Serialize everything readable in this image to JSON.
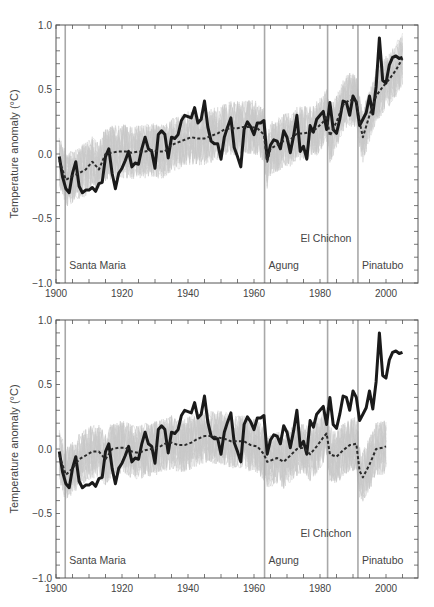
{
  "chart_data": [
    {
      "type": "line",
      "panel": "top",
      "title": "",
      "xlabel": "",
      "ylabel": "Temperature anomaly (°C)",
      "xlim": [
        1900,
        2008
      ],
      "ylim": [
        -1.0,
        1.0
      ],
      "x_ticks": [
        "1900",
        "1920",
        "1940",
        "1960",
        "1980",
        "2000"
      ],
      "y_ticks": [
        "1.0",
        "0.5",
        "0.0",
        "-0.5",
        "-1.0"
      ],
      "grid": false,
      "volcanoes": [
        {
          "name": "Santa Maria",
          "year": 1902.8,
          "label_row": "low"
        },
        {
          "name": "Agung",
          "year": 1963.2,
          "label_row": "low"
        },
        {
          "name": "El Chichon",
          "year": 1982.3,
          "label_row": "high"
        },
        {
          "name": "Pinatubo",
          "year": 1991.5,
          "label_row": "low"
        }
      ],
      "series": [
        {
          "name": "Observations",
          "style": "solid-thick-black",
          "x": [
            1901,
            1902,
            1903,
            1904,
            1905,
            1906,
            1907,
            1908,
            1909,
            1910,
            1911,
            1912,
            1913,
            1914,
            1915,
            1916,
            1917,
            1918,
            1919,
            1920,
            1921,
            1922,
            1923,
            1924,
            1925,
            1926,
            1927,
            1928,
            1929,
            1930,
            1931,
            1932,
            1933,
            1934,
            1935,
            1936,
            1937,
            1938,
            1939,
            1940,
            1941,
            1942,
            1943,
            1944,
            1945,
            1946,
            1947,
            1948,
            1949,
            1950,
            1951,
            1952,
            1953,
            1954,
            1955,
            1956,
            1957,
            1958,
            1959,
            1960,
            1961,
            1962,
            1963,
            1964,
            1965,
            1966,
            1967,
            1968,
            1969,
            1970,
            1971,
            1972,
            1973,
            1974,
            1975,
            1976,
            1977,
            1978,
            1979,
            1980,
            1981,
            1982,
            1983,
            1984,
            1985,
            1986,
            1987,
            1988,
            1989,
            1990,
            1991,
            1992,
            1993,
            1994,
            1995,
            1996,
            1997,
            1998,
            1999,
            2000,
            2001,
            2002,
            2003,
            2004,
            2005
          ],
          "values": [
            -0.02,
            -0.18,
            -0.27,
            -0.3,
            -0.15,
            -0.06,
            -0.25,
            -0.3,
            -0.28,
            -0.28,
            -0.26,
            -0.29,
            -0.23,
            -0.22,
            -0.02,
            0.04,
            -0.15,
            -0.27,
            -0.15,
            -0.11,
            -0.05,
            0.02,
            -0.1,
            -0.07,
            -0.08,
            0.04,
            0.13,
            0.04,
            0.02,
            -0.11,
            0.15,
            0.18,
            0.15,
            -0.03,
            0.13,
            0.12,
            0.15,
            0.26,
            0.3,
            0.29,
            0.28,
            0.36,
            0.24,
            0.27,
            0.41,
            0.21,
            0.1,
            0.08,
            0.08,
            -0.04,
            0.13,
            0.21,
            0.28,
            0.05,
            -0.02,
            -0.1,
            0.19,
            0.25,
            0.21,
            0.15,
            0.24,
            0.24,
            0.26,
            -0.04,
            0.07,
            0.11,
            0.1,
            0.04,
            0.18,
            0.13,
            0.01,
            0.14,
            0.3,
            0.02,
            0.06,
            -0.04,
            0.22,
            0.17,
            0.27,
            0.3,
            0.33,
            0.19,
            0.4,
            0.19,
            0.16,
            0.27,
            0.41,
            0.4,
            0.3,
            0.45,
            0.4,
            0.22,
            0.27,
            0.32,
            0.45,
            0.31,
            0.52,
            0.9,
            0.57,
            0.55,
            0.69,
            0.75,
            0.76,
            0.74,
            0.75
          ]
        },
        {
          "name": "Ensemble mean (all forcings)",
          "style": "dashed-black",
          "x": [
            1901,
            1903,
            1905,
            1907,
            1909,
            1911,
            1913,
            1915,
            1917,
            1919,
            1921,
            1923,
            1925,
            1927,
            1929,
            1931,
            1933,
            1935,
            1937,
            1939,
            1941,
            1943,
            1945,
            1947,
            1949,
            1951,
            1953,
            1955,
            1957,
            1959,
            1961,
            1963,
            1964,
            1965,
            1967,
            1969,
            1971,
            1973,
            1975,
            1977,
            1979,
            1981,
            1982,
            1983,
            1985,
            1987,
            1989,
            1991,
            1992,
            1993,
            1995,
            1997,
            1999,
            2001,
            2003,
            2005
          ],
          "values": [
            -0.05,
            -0.2,
            -0.17,
            -0.15,
            -0.12,
            -0.06,
            -0.12,
            0.0,
            0.01,
            0.02,
            0.02,
            0.01,
            0.02,
            0.02,
            0.03,
            0.02,
            0.02,
            0.07,
            0.09,
            0.11,
            0.13,
            0.12,
            0.12,
            0.14,
            0.16,
            0.19,
            0.2,
            0.2,
            0.21,
            0.21,
            0.2,
            0.15,
            -0.06,
            0.04,
            0.07,
            0.1,
            0.11,
            0.16,
            0.16,
            0.17,
            0.2,
            0.25,
            0.3,
            0.14,
            0.25,
            0.38,
            0.42,
            0.41,
            0.25,
            0.13,
            0.3,
            0.45,
            0.52,
            0.58,
            0.65,
            0.74
          ]
        }
      ]
    },
    {
      "type": "line",
      "panel": "bottom",
      "title": "",
      "xlabel": "",
      "ylabel": "Temperature anomaly (°C)",
      "xlim": [
        1900,
        2008
      ],
      "ylim": [
        -1.0,
        1.0
      ],
      "x_ticks": [
        "1900",
        "1920",
        "1940",
        "1960",
        "1980",
        "2000"
      ],
      "y_ticks": [
        "1.0",
        "0.5",
        "0.0",
        "-0.5",
        "-1.0"
      ],
      "grid": false,
      "volcanoes": [
        {
          "name": "Santa Maria",
          "year": 1902.8,
          "label_row": "low"
        },
        {
          "name": "Agung",
          "year": 1963.2,
          "label_row": "low"
        },
        {
          "name": "El Chichon",
          "year": 1982.3,
          "label_row": "high"
        },
        {
          "name": "Pinatubo",
          "year": 1991.5,
          "label_row": "low"
        }
      ],
      "series": [
        {
          "name": "Observations",
          "style": "solid-thick-black",
          "x": [
            1901,
            1902,
            1903,
            1904,
            1905,
            1906,
            1907,
            1908,
            1909,
            1910,
            1911,
            1912,
            1913,
            1914,
            1915,
            1916,
            1917,
            1918,
            1919,
            1920,
            1921,
            1922,
            1923,
            1924,
            1925,
            1926,
            1927,
            1928,
            1929,
            1930,
            1931,
            1932,
            1933,
            1934,
            1935,
            1936,
            1937,
            1938,
            1939,
            1940,
            1941,
            1942,
            1943,
            1944,
            1945,
            1946,
            1947,
            1948,
            1949,
            1950,
            1951,
            1952,
            1953,
            1954,
            1955,
            1956,
            1957,
            1958,
            1959,
            1960,
            1961,
            1962,
            1963,
            1964,
            1965,
            1966,
            1967,
            1968,
            1969,
            1970,
            1971,
            1972,
            1973,
            1974,
            1975,
            1976,
            1977,
            1978,
            1979,
            1980,
            1981,
            1982,
            1983,
            1984,
            1985,
            1986,
            1987,
            1988,
            1989,
            1990,
            1991,
            1992,
            1993,
            1994,
            1995,
            1996,
            1997,
            1998,
            1999,
            2000,
            2001,
            2002,
            2003,
            2004,
            2005
          ],
          "values": [
            -0.02,
            -0.18,
            -0.27,
            -0.3,
            -0.15,
            -0.06,
            -0.25,
            -0.3,
            -0.28,
            -0.28,
            -0.26,
            -0.29,
            -0.23,
            -0.22,
            -0.02,
            0.04,
            -0.15,
            -0.27,
            -0.15,
            -0.11,
            -0.05,
            0.02,
            -0.1,
            -0.07,
            -0.08,
            0.04,
            0.13,
            0.04,
            0.02,
            -0.11,
            0.15,
            0.18,
            0.15,
            -0.03,
            0.13,
            0.12,
            0.15,
            0.26,
            0.3,
            0.29,
            0.28,
            0.36,
            0.24,
            0.27,
            0.41,
            0.21,
            0.1,
            0.08,
            0.08,
            -0.04,
            0.13,
            0.21,
            0.28,
            0.05,
            -0.02,
            -0.1,
            0.19,
            0.25,
            0.21,
            0.15,
            0.24,
            0.24,
            0.26,
            -0.04,
            0.07,
            0.11,
            0.1,
            0.04,
            0.18,
            0.13,
            0.01,
            0.14,
            0.3,
            0.02,
            0.06,
            -0.04,
            0.22,
            0.17,
            0.27,
            0.3,
            0.33,
            0.19,
            0.4,
            0.19,
            0.16,
            0.27,
            0.41,
            0.4,
            0.3,
            0.45,
            0.4,
            0.22,
            0.27,
            0.32,
            0.45,
            0.31,
            0.52,
            0.9,
            0.57,
            0.55,
            0.69,
            0.75,
            0.76,
            0.74,
            0.75
          ]
        },
        {
          "name": "Ensemble mean (natural forcings only)",
          "style": "dashed-black",
          "x": [
            1901,
            1903,
            1905,
            1907,
            1909,
            1911,
            1913,
            1915,
            1917,
            1919,
            1921,
            1923,
            1925,
            1927,
            1929,
            1931,
            1933,
            1935,
            1937,
            1939,
            1941,
            1943,
            1945,
            1947,
            1949,
            1951,
            1953,
            1955,
            1957,
            1959,
            1961,
            1963,
            1964,
            1965,
            1967,
            1969,
            1971,
            1973,
            1975,
            1977,
            1979,
            1981,
            1982,
            1983,
            1985,
            1987,
            1989,
            1991,
            1992,
            1993,
            1995,
            1997,
            1999,
            2000
          ],
          "values": [
            -0.05,
            -0.2,
            -0.15,
            -0.08,
            -0.05,
            -0.02,
            -0.02,
            -0.08,
            0.0,
            0.01,
            0.01,
            -0.02,
            -0.03,
            -0.01,
            0.0,
            0.01,
            0.04,
            0.05,
            0.03,
            0.03,
            0.05,
            0.08,
            0.1,
            0.1,
            0.09,
            0.08,
            0.06,
            0.06,
            0.06,
            0.03,
            0.02,
            -0.04,
            -0.1,
            -0.09,
            -0.07,
            -0.1,
            -0.05,
            0.0,
            0.01,
            -0.04,
            0.02,
            0.09,
            0.12,
            -0.04,
            -0.06,
            -0.01,
            0.03,
            0.04,
            -0.17,
            -0.22,
            -0.12,
            0.0,
            0.01,
            0.02
          ]
        }
      ]
    }
  ],
  "y_axis_title": "Temperature anomaly (°C)",
  "colors": {
    "observations": "#1a1a1a",
    "model_mean": "#2a2a2a",
    "ensemble_spread": "#c8c8c8",
    "volcano_line": "#a8a8a8",
    "axis": "#555555"
  }
}
